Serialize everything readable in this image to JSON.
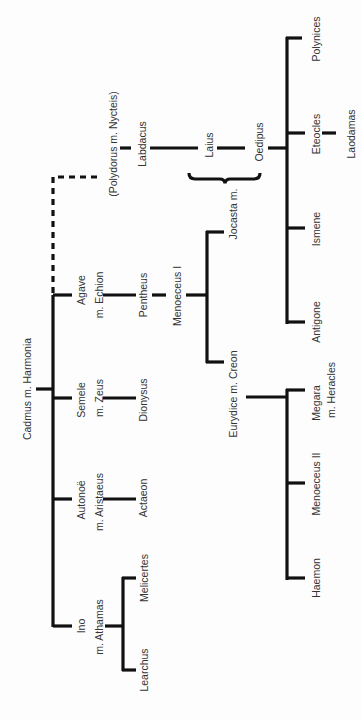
{
  "diagram": {
    "type": "family-tree",
    "orientation": "rotated-90-ccw",
    "colors": {
      "line": "#111111",
      "text": "#333333",
      "background": "#fdfdfd"
    },
    "nodes": {
      "cadmus": "Cadmus m. Harmonia",
      "polydorus": "(Polydorus m. Nycteis)",
      "labdacus": "Labdacus",
      "laius": "Laius",
      "jocasta": "Jocasta m.",
      "oedipus": "Oedipus",
      "polynices": "Polynices",
      "eteocles": "Eteocles",
      "laodamas": "Laodamas",
      "ismene": "Ismene",
      "antigone": "Antigone",
      "agave": "Agave",
      "agave_spouse": "m. Echion",
      "pentheus": "Pentheus",
      "menoeceus1": "Menoeceus I",
      "creon": "Eurydice m. Creon",
      "megara": "Megara",
      "megara_spouse": "m. Heracles",
      "menoeceus2": "Menoeceus II",
      "haemon": "Haemon",
      "semele": "Semele",
      "semele_spouse": "m. Zeus",
      "dionysus": "Dionysus",
      "autonoe": "Autonoë",
      "autonoe_spouse": "m. Aristaeus",
      "actaeon": "Actaeon",
      "ino": "Ino",
      "ino_spouse": "m. Athamas",
      "melicertes": "Melicertes",
      "learchus": "Learchus"
    },
    "edges": [
      [
        "Cadmus m. Harmonia",
        "Agave m. Echion"
      ],
      [
        "Cadmus m. Harmonia",
        "Semele m. Zeus"
      ],
      [
        "Cadmus m. Harmonia",
        "Autonoë m. Aristaeus"
      ],
      [
        "Cadmus m. Harmonia",
        "Ino m. Athamas"
      ],
      [
        "Cadmus m. Harmonia",
        "(Polydorus m. Nycteis)",
        "dashed"
      ],
      [
        "(Polydorus m. Nycteis)",
        "Labdacus"
      ],
      [
        "Labdacus",
        "Laius"
      ],
      [
        "Laius",
        "Oedipus"
      ],
      [
        "Oedipus",
        "Polynices"
      ],
      [
        "Oedipus",
        "Eteocles"
      ],
      [
        "Eteocles",
        "Laodamas"
      ],
      [
        "Oedipus",
        "Ismene"
      ],
      [
        "Oedipus",
        "Antigone"
      ],
      [
        "Agave m. Echion",
        "Pentheus"
      ],
      [
        "Pentheus",
        "Menoeceus I"
      ],
      [
        "Menoeceus I",
        "Jocasta m."
      ],
      [
        "Menoeceus I",
        "Eurydice m. Creon"
      ],
      [
        "Eurydice m. Creon",
        "Megara m. Heracles"
      ],
      [
        "Eurydice m. Creon",
        "Menoeceus II"
      ],
      [
        "Eurydice m. Creon",
        "Haemon"
      ],
      [
        "Semele m. Zeus",
        "Dionysus"
      ],
      [
        "Autonoë m. Aristaeus",
        "Actaeon"
      ],
      [
        "Ino m. Athamas",
        "Melicertes"
      ],
      [
        "Ino m. Athamas",
        "Learchus"
      ]
    ]
  }
}
